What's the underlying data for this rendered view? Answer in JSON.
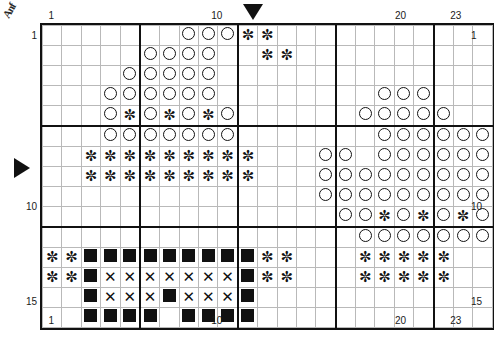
{
  "chart": {
    "title_fragment": "Anf",
    "columns": 23,
    "rows": 15,
    "cell_width_px": 18.39,
    "cell_height_px": 19,
    "major_interval": 5,
    "colors": {
      "symbol": "#111111",
      "grid_minor": "#b9b9b9",
      "grid_major": "#111111",
      "background": "#ffffff"
    },
    "column_labels_top": [
      {
        "value": "1",
        "col": 1
      },
      {
        "value": "10",
        "col": 10
      },
      {
        "value": "20",
        "col": 20
      },
      {
        "value": "23",
        "col": 23
      }
    ],
    "column_labels_bottom": [
      {
        "value": "1",
        "col": 1
      },
      {
        "value": "10",
        "col": 10
      },
      {
        "value": "20",
        "col": 20
      },
      {
        "value": "23",
        "col": 23
      }
    ],
    "row_labels_left": [
      {
        "value": "1",
        "row": 1
      },
      {
        "value": "10",
        "row": 10
      },
      {
        "value": "15",
        "row": 15
      }
    ],
    "row_labels_right": [
      {
        "value": "1",
        "row": 1
      },
      {
        "value": "10",
        "row": 10
      },
      {
        "value": "15",
        "row": 15
      }
    ],
    "markers": [
      {
        "name": "start-column-marker",
        "icon": "triangle-down-icon",
        "col": 12,
        "position": "top"
      },
      {
        "name": "start-row-marker",
        "icon": "triangle-right-icon",
        "row": 8,
        "position": "left"
      }
    ],
    "symbol_legend": [
      {
        "key": "O",
        "name": "open-circle",
        "glyph": "circle"
      },
      {
        "key": "*",
        "name": "asterisk",
        "glyph": "star"
      },
      {
        "key": "#",
        "name": "filled-square",
        "glyph": "square"
      },
      {
        "key": "X",
        "name": "cross",
        "glyph": "cross"
      }
    ],
    "pattern": [
      ".......OOO**...........",
      ".....OOOO..**..........",
      "....OOOOO..............",
      "...OOOOOO........OOO...",
      "...O*O*O*O......OOOOO..",
      "...OOOOOOO.......OOOOOO",
      "..*********...OO.OOOOOO",
      "..*********...OOOOOOOOO",
      "..............OOOOOOOOO",
      "...............OO*O*O*O",
      "................OOOOOOO",
      "**#########**...*****..",
      "**#XXXXXXX#**...*****..",
      "..#XXX#XXX#............",
      "..####.####............"
    ]
  }
}
